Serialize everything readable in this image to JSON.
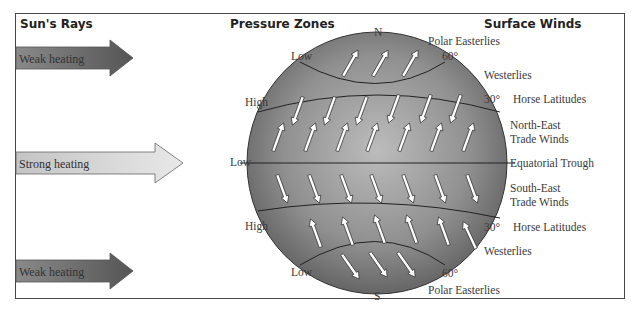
{
  "headers": {
    "sun_rays": "Sun's Rays",
    "pressure_zones": "Pressure Zones",
    "surface_winds": "Surface Winds"
  },
  "sun_arrows": [
    {
      "label": "Weak heating",
      "shade": "dark"
    },
    {
      "label": "Strong heating",
      "shade": "light"
    },
    {
      "label": "Weak heating",
      "shade": "dark"
    }
  ],
  "globe": {
    "north": "N",
    "south": "S"
  },
  "pressure": {
    "low_north": "Low",
    "high_north": "High",
    "low_equator": "Low",
    "high_south": "High",
    "low_south": "Low"
  },
  "winds": {
    "polar_easterlies_n": "Polar  Easterlies",
    "lat60_n": "60°",
    "westerlies_n": "Westerlies",
    "lat30_n": "30°",
    "horse_latitudes_n": "Horse Latitudes",
    "ne_trade_1": "North-East",
    "ne_trade_2": "Trade Winds",
    "equatorial_trough": "Equatorial Trough",
    "se_trade_1": "South-East",
    "se_trade_2": "Trade Winds",
    "lat30_s": "30°",
    "horse_latitudes_s": "Horse Latitudes",
    "westerlies_s": "Westerlies",
    "lat60_s": "60°",
    "polar_easterlies_s": "Polar  Easterlies"
  },
  "colors": {
    "globe_dark": "#5e5e5e",
    "globe_light": "#b8b8b8",
    "line": "#222222"
  }
}
